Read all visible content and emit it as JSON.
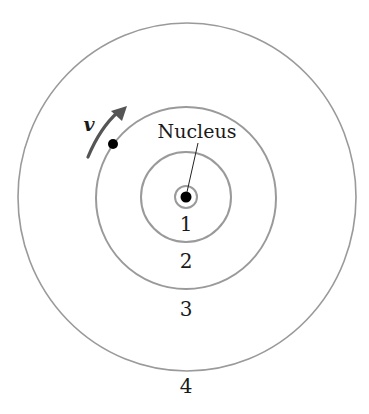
{
  "diagram": {
    "nucleus_label": "Nucleus",
    "velocity_label": "v",
    "orbit_labels": [
      "1",
      "2",
      "3",
      "4"
    ],
    "colors": {
      "orbit": "#9a9a9a",
      "arrow": "#555555",
      "particle": "#000000",
      "text": "#1a1a1a"
    }
  }
}
